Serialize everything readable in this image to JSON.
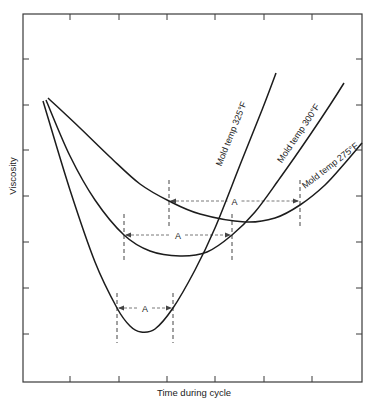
{
  "chart_data": {
    "type": "line",
    "title": "",
    "xlabel": "Time during cycle",
    "ylabel": "Viscosity",
    "grid": false,
    "legend": "inline curve labels",
    "x_ticks_count": 6,
    "y_ticks_count": 7,
    "tick_labels": "none (unlabeled ticks)",
    "frame_px": {
      "left": 23,
      "top": 14,
      "right": 362,
      "bottom": 382
    },
    "x_ticks_px": [
      70,
      119,
      167,
      215,
      264,
      312
    ],
    "y_ticks_px": [
      59,
      105,
      150,
      196,
      242,
      288,
      334
    ],
    "series": [
      {
        "name": "Mold temp 325°F",
        "label": "Mold temp 325°F",
        "points_px": [
          [
            43,
            101
          ],
          [
            70,
            190
          ],
          [
            95,
            262
          ],
          [
            117,
            308
          ],
          [
            130,
            326
          ],
          [
            141,
            332
          ],
          [
            155,
            329
          ],
          [
            173,
            308
          ],
          [
            195,
            270
          ],
          [
            215,
            228
          ],
          [
            240,
            165
          ],
          [
            262,
            110
          ],
          [
            276,
            73
          ]
        ],
        "interval_A": {
          "x_start": 117,
          "x_end": 173,
          "arrow_y": 308,
          "dash_top": 293,
          "dash_bottom": 343,
          "label": "A"
        },
        "min_px": [
          141,
          332
        ]
      },
      {
        "name": "Mold temp 300°F",
        "label": "Mold temp 300°F",
        "points_px": [
          [
            46,
            100
          ],
          [
            70,
            156
          ],
          [
            95,
            200
          ],
          [
            124,
            235
          ],
          [
            150,
            251
          ],
          [
            180,
            256
          ],
          [
            207,
            252
          ],
          [
            232,
            235
          ],
          [
            255,
            212
          ],
          [
            280,
            178
          ],
          [
            310,
            135
          ],
          [
            330,
            105
          ],
          [
            344,
            83
          ]
        ],
        "interval_A": {
          "x_start": 124,
          "x_end": 232,
          "arrow_y": 235,
          "dash_top": 214,
          "dash_bottom": 262,
          "label": "A"
        },
        "min_px": [
          180,
          256
        ]
      },
      {
        "name": "Mold temp 275°F",
        "label": "Mold temp 275°F",
        "points_px": [
          [
            48,
            98
          ],
          [
            80,
            128
          ],
          [
            110,
            157
          ],
          [
            140,
            184
          ],
          [
            169,
            201
          ],
          [
            200,
            214
          ],
          [
            245,
            222
          ],
          [
            275,
            218
          ],
          [
            300,
            205
          ],
          [
            325,
            185
          ],
          [
            345,
            163
          ],
          [
            362,
            143
          ]
        ],
        "interval_A": {
          "x_start": 169,
          "x_end": 300,
          "arrow_y": 201,
          "dash_top": 180,
          "dash_bottom": 228,
          "label": "A"
        },
        "min_px": [
          245,
          222
        ]
      }
    ],
    "annotations": [
      {
        "text": "Mold temp 325°F",
        "x": 234,
        "y": 135,
        "rotate": -68
      },
      {
        "text": "Mold temp 300°F",
        "x": 301,
        "y": 135,
        "rotate": -56
      },
      {
        "text": "Mold temp 275°F",
        "x": 332,
        "y": 168,
        "rotate": -38
      },
      {
        "text": "A",
        "note": "time interval between equal-viscosity points on each curve"
      }
    ]
  }
}
